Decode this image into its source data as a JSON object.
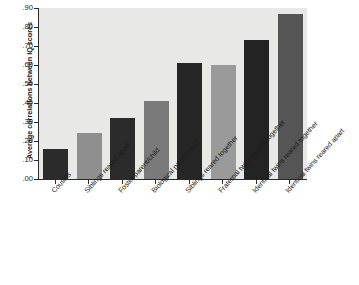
{
  "chart_data": {
    "type": "bar",
    "title": "",
    "subtitle": "",
    "xlabel": "",
    "ylabel": "Average correlations between IQ scores",
    "categories": [
      "Cousins",
      "Siblings reared apart",
      "Foster parent/child",
      "Biological parent/child",
      "Siblings reared together",
      "Fraternal twins reared together",
      "Identical twins reared together",
      "Identical twins reared apart"
    ],
    "values": [
      0.16,
      0.24,
      0.32,
      0.41,
      0.61,
      0.6,
      0.73,
      0.87
    ],
    "value_labels": [
      ".16",
      ".24",
      ".32",
      ".41",
      ".61",
      ".60",
      ".73",
      ".87"
    ],
    "bar_colors": [
      "#2b2b2b",
      "#8f8f8f",
      "#2b2b2b",
      "#7a7a7a",
      "#262626",
      "#9a9a9a",
      "#232323",
      "#555555"
    ],
    "ylim": [
      0.0,
      0.9
    ],
    "ytick_values": [
      0.0,
      0.1,
      0.2,
      0.3,
      0.4,
      0.5,
      0.6,
      0.7,
      0.8,
      0.9
    ],
    "ytick_labels": [
      ".00",
      ".10",
      ".20",
      ".30",
      ".40",
      ".50",
      ".60",
      ".70",
      ".80",
      ".90"
    ],
    "grid": false,
    "legend": false,
    "legend_position": "none",
    "plot_background": "#e8e8e6",
    "page_background": "#ffffff",
    "axis_color": "#2a2a2a"
  }
}
